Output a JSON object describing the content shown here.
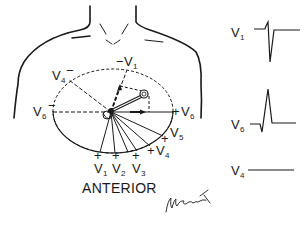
{
  "diagram": {
    "title": "ANTERIOR",
    "signature": "signature",
    "ink_color": "#1a1a1a",
    "background": "#ffffff",
    "left_panel": {
      "description": "Horizontal plane of chest with precordial lead axes and heart vector",
      "lead_labels": [
        {
          "id": "V1-neg",
          "sign": "−",
          "lead": "V",
          "sub": "1"
        },
        {
          "id": "V4-neg",
          "sign": "−",
          "lead": "V",
          "sub": "4"
        },
        {
          "id": "V6-neg",
          "sign": "−",
          "lead": "V",
          "sub": "6"
        },
        {
          "id": "V6-pos",
          "sign": "+",
          "lead": "V",
          "sub": "6"
        },
        {
          "id": "V5-pos",
          "sign": "+",
          "lead": "V",
          "sub": "5"
        },
        {
          "id": "V4-pos",
          "sign": "+",
          "lead": "V",
          "sub": "4"
        },
        {
          "id": "V1-pos",
          "sign": "+",
          "lead": "V",
          "sub": "1"
        },
        {
          "id": "V2-pos",
          "sign": "+",
          "lead": "V",
          "sub": "2"
        },
        {
          "id": "V3-pos",
          "sign": "+",
          "lead": "V",
          "sub": "3"
        }
      ]
    },
    "right_panel": {
      "traces": [
        {
          "lead": "V",
          "sub": "1",
          "pattern": "small r, deep S (negative QRS)"
        },
        {
          "lead": "V",
          "sub": "6",
          "pattern": "small q, tall R (positive QRS)"
        },
        {
          "lead": "V",
          "sub": "4",
          "pattern": "flat (isoelectric)"
        }
      ]
    }
  }
}
